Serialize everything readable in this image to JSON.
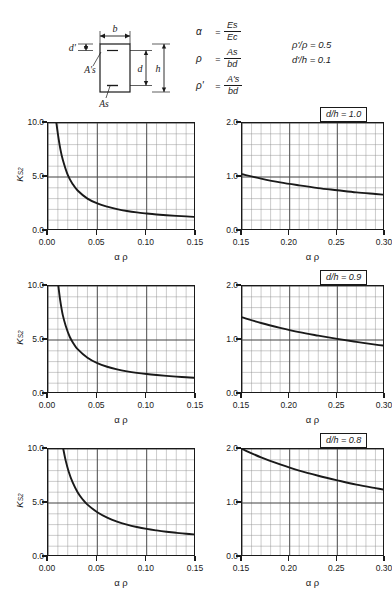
{
  "header": {
    "section_diagram": {
      "label_b": "b",
      "label_dprime": "d'",
      "label_d": "d",
      "label_h": "h",
      "label_as_top": "A's",
      "label_as_bottom": "As"
    },
    "definitions": [
      {
        "symbol": "α",
        "equals": "=",
        "numerator": "Es",
        "denominator": "Ec"
      },
      {
        "symbol": "ρ",
        "equals": "=",
        "numerator": "As",
        "denominator": "bd"
      },
      {
        "symbol": "ρ'",
        "equals": "=",
        "numerator": "A's",
        "denominator": "bd"
      }
    ],
    "parameters": [
      "ρ'/ρ = 0.5",
      "d'/h = 0.1"
    ]
  },
  "axis_titles": {
    "x": "α ρ",
    "y": "K",
    "y_sub": "S2"
  },
  "chart_data": [
    {
      "type": "line",
      "title": "d/h = 1.0",
      "panel": "left",
      "xlabel": "α ρ",
      "ylabel": "K_S2",
      "xlim": [
        0.0,
        0.15
      ],
      "ylim": [
        0.0,
        10.0
      ],
      "xticks": [
        0.0,
        0.05,
        0.1,
        0.15
      ],
      "xticklabels": [
        "0.00",
        "0.05",
        "0.10",
        "0.15"
      ],
      "yticks": [
        0.0,
        5.0,
        10.0
      ],
      "yticklabels": [
        "0.0",
        "5.0",
        "10.0"
      ],
      "grid": true,
      "x": [
        0.0085,
        0.01,
        0.0125,
        0.015,
        0.02,
        0.025,
        0.03,
        0.04,
        0.05,
        0.06,
        0.07,
        0.08,
        0.09,
        0.1,
        0.11,
        0.12,
        0.13,
        0.14,
        0.15
      ],
      "values": [
        10.0,
        9.0,
        7.6,
        6.6,
        5.2,
        4.35,
        3.75,
        3.0,
        2.55,
        2.25,
        2.02,
        1.85,
        1.72,
        1.62,
        1.53,
        1.46,
        1.4,
        1.35,
        1.3
      ]
    },
    {
      "type": "line",
      "title": "d/h = 1.0",
      "panel": "right",
      "xlabel": "α ρ",
      "ylabel": "K_S2",
      "xlim": [
        0.15,
        0.3
      ],
      "ylim": [
        0.0,
        2.0
      ],
      "xticks": [
        0.15,
        0.2,
        0.25,
        0.3
      ],
      "xticklabels": [
        "0.15",
        "0.20",
        "0.25",
        "0.30"
      ],
      "yticks": [
        0.0,
        1.0,
        2.0
      ],
      "yticklabels": [
        "0.0",
        "1.0",
        "2.0"
      ],
      "grid": true,
      "x": [
        0.15,
        0.17,
        0.19,
        0.21,
        0.23,
        0.25,
        0.27,
        0.29,
        0.3
      ],
      "values": [
        1.05,
        0.97,
        0.9,
        0.845,
        0.795,
        0.755,
        0.715,
        0.685,
        0.67
      ]
    },
    {
      "type": "line",
      "title": "d/h = 0.9",
      "panel": "left",
      "xlabel": "α ρ",
      "ylabel": "K_S2",
      "xlim": [
        0.0,
        0.15
      ],
      "ylim": [
        0.0,
        10.0
      ],
      "xticks": [
        0.0,
        0.05,
        0.1,
        0.15
      ],
      "xticklabels": [
        "0.00",
        "0.05",
        "0.10",
        "0.15"
      ],
      "yticks": [
        0.0,
        5.0,
        10.0
      ],
      "yticklabels": [
        "0.0",
        "5.0",
        "10.0"
      ],
      "grid": true,
      "x": [
        0.0105,
        0.0125,
        0.015,
        0.018,
        0.022,
        0.026,
        0.03,
        0.04,
        0.05,
        0.06,
        0.07,
        0.08,
        0.09,
        0.1,
        0.11,
        0.12,
        0.13,
        0.14,
        0.15
      ],
      "values": [
        10.0,
        8.6,
        7.3,
        6.3,
        5.3,
        4.65,
        4.15,
        3.35,
        2.85,
        2.52,
        2.28,
        2.1,
        1.96,
        1.85,
        1.76,
        1.68,
        1.61,
        1.55,
        1.5
      ]
    },
    {
      "type": "line",
      "title": "d/h = 0.9",
      "panel": "right",
      "xlabel": "α ρ",
      "ylabel": "K_S2",
      "xlim": [
        0.15,
        0.3
      ],
      "ylim": [
        0.0,
        2.0
      ],
      "xticks": [
        0.15,
        0.2,
        0.25,
        0.3
      ],
      "xticklabels": [
        "0.15",
        "0.20",
        "0.25",
        "0.30"
      ],
      "yticks": [
        0.0,
        1.0,
        2.0
      ],
      "yticklabels": [
        "0.0",
        "1.0",
        "2.0"
      ],
      "grid": true,
      "x": [
        0.15,
        0.17,
        0.19,
        0.21,
        0.23,
        0.25,
        0.27,
        0.29,
        0.3
      ],
      "values": [
        1.42,
        1.315,
        1.225,
        1.145,
        1.08,
        1.02,
        0.965,
        0.915,
        0.895
      ]
    },
    {
      "type": "line",
      "title": "d/h = 0.8",
      "panel": "left",
      "xlabel": "α ρ",
      "ylabel": "K_S2",
      "xlim": [
        0.0,
        0.15
      ],
      "ylim": [
        0.0,
        10.0
      ],
      "xticks": [
        0.0,
        0.05,
        0.1,
        0.15
      ],
      "xticklabels": [
        "0.00",
        "0.05",
        "0.10",
        "0.15"
      ],
      "yticks": [
        0.0,
        5.0,
        10.0
      ],
      "yticklabels": [
        "0.0",
        "5.0",
        "10.0"
      ],
      "grid": true,
      "x": [
        0.0155,
        0.018,
        0.021,
        0.025,
        0.03,
        0.035,
        0.04,
        0.05,
        0.06,
        0.07,
        0.08,
        0.09,
        0.1,
        0.11,
        0.12,
        0.13,
        0.14,
        0.15
      ],
      "values": [
        10.0,
        8.9,
        7.9,
        6.9,
        6.0,
        5.35,
        4.85,
        4.15,
        3.65,
        3.28,
        3.0,
        2.78,
        2.6,
        2.46,
        2.34,
        2.24,
        2.15,
        2.08
      ]
    },
    {
      "type": "line",
      "title": "d/h = 0.8",
      "panel": "right",
      "xlabel": "α ρ",
      "ylabel": "K_S2",
      "xlim": [
        0.15,
        0.3
      ],
      "ylim": [
        0.0,
        2.0
      ],
      "xticks": [
        0.15,
        0.2,
        0.25,
        0.3
      ],
      "xticklabels": [
        "0.15",
        "0.20",
        "0.25",
        "0.30"
      ],
      "yticks": [
        0.0,
        1.0,
        2.0
      ],
      "yticklabels": [
        "0.0",
        "1.0",
        "2.0"
      ],
      "grid": true,
      "x": [
        0.15,
        0.17,
        0.19,
        0.21,
        0.23,
        0.25,
        0.27,
        0.29,
        0.3
      ],
      "values": [
        2.0,
        1.845,
        1.715,
        1.6,
        1.505,
        1.42,
        1.34,
        1.275,
        1.245
      ]
    }
  ],
  "style": {
    "ink": "#1a1a1a",
    "grid_minor": "#8c8c8c",
    "grid_major": "#4a4a4a"
  }
}
